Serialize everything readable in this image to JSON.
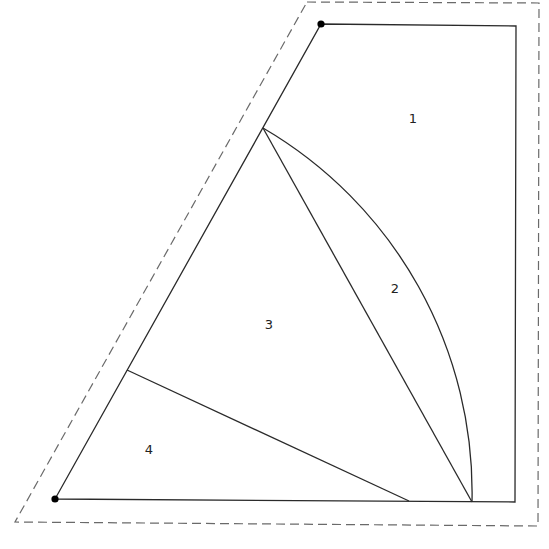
{
  "diagram": {
    "regions": [
      {
        "id": "region-1",
        "label": "1"
      },
      {
        "id": "region-2",
        "label": "2"
      },
      {
        "id": "region-3",
        "label": "3"
      },
      {
        "id": "region-4",
        "label": "4"
      }
    ],
    "marked_points": [
      "top-left-vertex",
      "bottom-left-vertex"
    ],
    "colors": {
      "stroke": "#2a2a2a",
      "dashed_stroke": "#6a6a6a",
      "dot": "#000000",
      "background": "#ffffff"
    }
  }
}
